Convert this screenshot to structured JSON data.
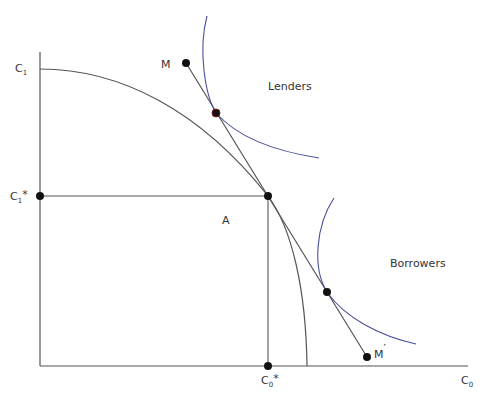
{
  "diagram": {
    "type": "economics-investment-frontier",
    "axes": {
      "y_label": "C",
      "y_label_sub": "1",
      "x_label": "C",
      "x_label_sub": "0"
    },
    "points": {
      "c1_star_label": "C",
      "c1_star_sub": "1",
      "c1_star_mark": "*",
      "c0_star_label": "C",
      "c0_star_sub": "0",
      "c0_star_mark": "*",
      "a_label": "A",
      "m_label": "M",
      "m_prime_label": "M",
      "m_prime_mark": "′"
    },
    "regions": {
      "lenders": "Lenders",
      "borrowers": "Borrowers"
    },
    "colors": {
      "indifference_curve": "#4a4f9a",
      "line": "#555555",
      "point": "#111111"
    }
  }
}
